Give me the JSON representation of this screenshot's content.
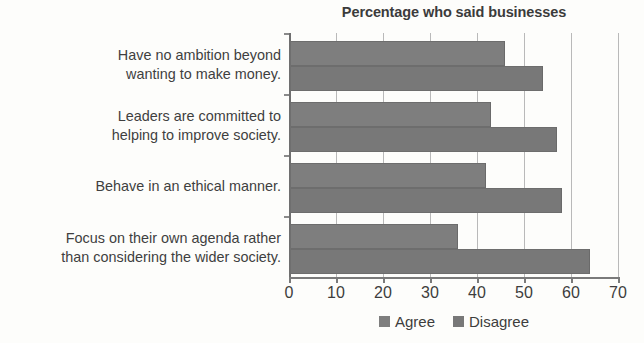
{
  "chart_data": {
    "type": "bar",
    "orientation": "horizontal",
    "title": "Percentage who said businesses",
    "xlabel": "",
    "ylabel": "",
    "xlim": [
      0,
      70
    ],
    "xticks": [
      0,
      10,
      20,
      30,
      40,
      50,
      60,
      70
    ],
    "grid": true,
    "legend_position": "bottom",
    "categories": [
      "Have no ambition beyond wanting to make money.",
      "Leaders are committed to helping to improve society.",
      "Behave in an ethical manner.",
      "Focus on their own agenda rather than considering the wider society."
    ],
    "category_lines": [
      [
        "Have no ambition beyond",
        "wanting to make money."
      ],
      [
        "Leaders are committed to",
        "helping to improve society."
      ],
      [
        "Behave in an ethical manner."
      ],
      [
        "Focus on their own agenda rather",
        "than considering the wider society."
      ]
    ],
    "series": [
      {
        "name": "Agree",
        "color": "#7e7e7e",
        "values": [
          46,
          43,
          42,
          36
        ]
      },
      {
        "name": "Disagree",
        "color": "#787878",
        "values": [
          54,
          57,
          58,
          64
        ]
      }
    ]
  },
  "legend": {
    "items": [
      {
        "label": "Agree",
        "color": "#7e7e7e"
      },
      {
        "label": "Disagree",
        "color": "#787878"
      }
    ]
  },
  "axis": {
    "tick_labels": [
      "0",
      "10",
      "20",
      "30",
      "40",
      "50",
      "60",
      "70"
    ]
  }
}
